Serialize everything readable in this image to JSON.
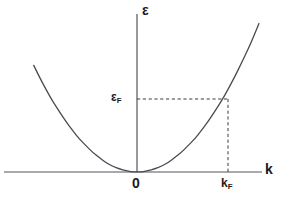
{
  "figure": {
    "kind": "physics-dispersion-plot",
    "background_color": "#ffffff",
    "line_color": "#4a4a52",
    "text_color": "#1a1a1a"
  },
  "labels": {
    "y_axis": "ε",
    "x_axis": "k",
    "origin": "0",
    "fermi_energy_symbol": "ε",
    "fermi_energy_subscript": "F",
    "fermi_wavevector_symbol": "k",
    "fermi_wavevector_subscript": "F"
  },
  "chart_data": {
    "type": "line",
    "title": "",
    "xlabel": "k",
    "ylabel": "ε",
    "grid": false,
    "legend": "none",
    "curve_name": "free-electron parabolic dispersion",
    "relation": "ε = ħ²k² / 2m",
    "xlim": [
      -1.16,
      1.37
    ],
    "ylim": [
      0,
      1.35
    ],
    "x_tick_labels": [
      "0",
      "k_F"
    ],
    "x_tick_values": [
      0,
      1.0
    ],
    "y_tick_labels": [
      "ε_F"
    ],
    "y_tick_values": [
      0.92
    ],
    "annotations": [
      {
        "name": "fermi-energy-guide",
        "style": "dashed",
        "from": [
          0,
          0.92
        ],
        "to": [
          1.0,
          0.92
        ]
      },
      {
        "name": "fermi-wavevector-guide",
        "style": "dashed",
        "from": [
          1.0,
          0.92
        ],
        "to": [
          1.0,
          0
        ]
      }
    ],
    "x": [
      -1.16,
      -1.1,
      -1.02,
      -0.95,
      -0.87,
      -0.8,
      -0.72,
      -0.65,
      -0.57,
      -0.5,
      -0.42,
      -0.35,
      -0.27,
      -0.2,
      -0.12,
      -0.05,
      0.0,
      0.05,
      0.12,
      0.2,
      0.27,
      0.35,
      0.42,
      0.5,
      0.57,
      0.65,
      0.72,
      0.8,
      0.87,
      0.95,
      1.02,
      1.1,
      1.17,
      1.25,
      1.32,
      1.37
    ],
    "y": [
      1.35,
      1.21,
      1.04,
      0.9,
      0.76,
      0.64,
      0.52,
      0.42,
      0.33,
      0.25,
      0.18,
      0.12,
      0.07,
      0.04,
      0.015,
      0.003,
      0.0,
      0.003,
      0.015,
      0.04,
      0.07,
      0.12,
      0.18,
      0.25,
      0.33,
      0.42,
      0.52,
      0.64,
      0.76,
      0.9,
      1.04,
      1.21,
      1.37,
      1.56,
      1.74,
      1.88
    ]
  },
  "geometry": {
    "origin_px": [
      137,
      172
    ],
    "x_axis_px": {
      "x1": 4,
      "y1": 172,
      "x2": 262,
      "y2": 172
    },
    "y_axis_px": {
      "x1": 137,
      "y1": 14,
      "x2": 137,
      "y2": 172
    },
    "fermi_point_px": [
      228,
      99
    ],
    "scale_px_per_unit": {
      "x": 89,
      "y": 79
    }
  }
}
